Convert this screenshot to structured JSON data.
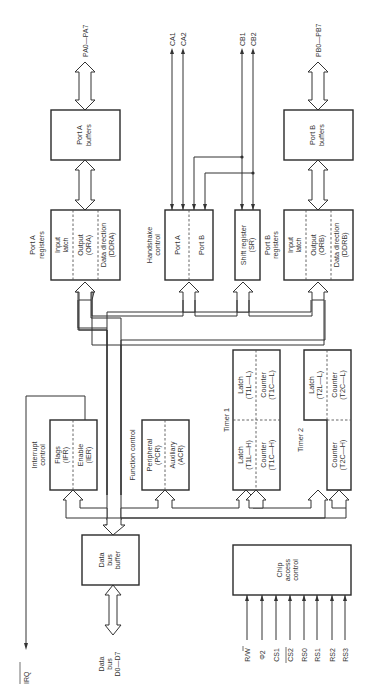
{
  "diagram": {
    "orientation": "rotated-90-ccw",
    "blocks": {
      "port_a_buffers": {
        "line1": "Port A",
        "line2": "buffers"
      },
      "port_b_buffers": {
        "line1": "Port B",
        "line2": "buffers"
      },
      "port_a_registers": {
        "title1": "Port A",
        "title2": "registers",
        "sections": [
          {
            "line1": "Input",
            "line2": "latch"
          },
          {
            "line1": "Output",
            "line2": "(ORA)"
          },
          {
            "line1": "Data direction",
            "line2": "(DDRA)"
          }
        ]
      },
      "port_b_registers": {
        "title1": "Port B",
        "title2": "registers",
        "sections": [
          {
            "line1": "Input",
            "line2": "latch"
          },
          {
            "line1": "Output",
            "line2": "(ORB)"
          },
          {
            "line1": "Data direction",
            "line2": "(DDRB)"
          }
        ]
      },
      "handshake_control": {
        "title1": "Handshake",
        "title2": "control",
        "sections": [
          {
            "label": "Port A"
          },
          {
            "label": "Port B"
          }
        ]
      },
      "shift_register": {
        "line1": "Shift register",
        "line2": "(SR)"
      },
      "interrupt_control": {
        "title1": "Interrupt",
        "title2": "control",
        "sections": [
          {
            "line1": "Flags",
            "line2": "(IFR)"
          },
          {
            "line1": "Enable",
            "line2": "(IER)"
          }
        ]
      },
      "function_control": {
        "title": "Function control",
        "sections": [
          {
            "line1": "Peripheral",
            "line2": "(PCR)"
          },
          {
            "line1": "Auxiliary",
            "line2": "(ACR)"
          }
        ]
      },
      "data_bus_buffer": {
        "line1": "Data",
        "line2": "bus",
        "line3": "buffer"
      },
      "timer1": {
        "title": "Timer 1",
        "cells": [
          {
            "line1": "Latch",
            "line2": "(T1L—H)"
          },
          {
            "line1": "Latch",
            "line2": "(T1L—L)"
          },
          {
            "line1": "Counter",
            "line2": "(T1C—H)"
          },
          {
            "line1": "Counter",
            "line2": "(T1C—L)"
          }
        ]
      },
      "timer2": {
        "title": "Timer 2",
        "cells": [
          {
            "line1": "Latch",
            "line2": "(T2L—L)"
          },
          {
            "line1": "Counter",
            "line2": "(T2C—H)"
          },
          {
            "line1": "Counter",
            "line2": "(T2C—L)"
          }
        ]
      },
      "chip_access_control": {
        "line1": "Chip",
        "line2": "access",
        "line3": "control"
      }
    },
    "signals": {
      "pa": "PA0—PA7",
      "pb": "PB0—PB7",
      "ca1": "CA1",
      "ca2": "CA2",
      "cb1": "CB1",
      "cb2": "CB2",
      "irq": "IRQ",
      "data_bus": {
        "line1": "Data",
        "line2": "bus",
        "line3": "D0—D7"
      },
      "chip_inputs": [
        "R/W",
        "Φ2",
        "CS1",
        "CS2",
        "RS0",
        "RS1",
        "RS2",
        "RS3"
      ]
    },
    "colors": {
      "line": "#333333",
      "background": "#ffffff"
    }
  }
}
